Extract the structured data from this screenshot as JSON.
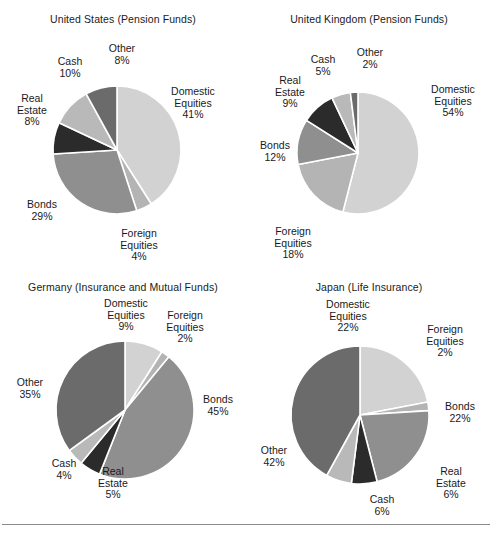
{
  "figure": {
    "background": "#ffffff",
    "rule_color": "#8c8c8c"
  },
  "palette": {
    "domestic_equities": "#d2d2d2",
    "foreign_equities": "#b4b4b4",
    "bonds": "#8f8f8f",
    "real_estate": "#2b2b2b",
    "cash": "#b9b9b9",
    "other": "#6b6b6b",
    "slice_outline": "#ffffff"
  },
  "panels": [
    {
      "id": "us",
      "title": "United States (Pension Funds)",
      "labels": [
        {
          "name": "Domestic\nEquities",
          "line1": "Domestic",
          "line2": "Equities",
          "pct": "41%"
        },
        {
          "name": "Foreign\nEquities",
          "line1": "Foreign",
          "line2": "Equities",
          "pct": "4%"
        },
        {
          "name": "Bonds",
          "line1": "Bonds",
          "line2": "",
          "pct": "29%"
        },
        {
          "name": "Real\nEstate",
          "line1": "Real",
          "line2": "Estate",
          "pct": "8%"
        },
        {
          "name": "Cash",
          "line1": "Cash",
          "line2": "",
          "pct": "10%"
        },
        {
          "name": "Other",
          "line1": "Other",
          "line2": "",
          "pct": "8%"
        }
      ]
    },
    {
      "id": "uk",
      "title": "United Kingdom (Pension Funds)",
      "labels": [
        {
          "name": "Domestic\nEquities",
          "line1": "Domestic",
          "line2": "Equities",
          "pct": "54%"
        },
        {
          "name": "Foreign\nEquities",
          "line1": "Foreign",
          "line2": "Equities",
          "pct": "18%"
        },
        {
          "name": "Bonds",
          "line1": "Bonds",
          "line2": "",
          "pct": "12%"
        },
        {
          "name": "Real\nEstate",
          "line1": "Real",
          "line2": "Estate",
          "pct": "9%"
        },
        {
          "name": "Cash",
          "line1": "Cash",
          "line2": "",
          "pct": "5%"
        },
        {
          "name": "Other",
          "line1": "Other",
          "line2": "",
          "pct": "2%"
        }
      ]
    },
    {
      "id": "de",
      "title": "Germany (Insurance and Mutual Funds)",
      "labels": [
        {
          "name": "Domestic\nEquities",
          "line1": "Domestic",
          "line2": "Equities",
          "pct": "9%"
        },
        {
          "name": "Foreign\nEquities",
          "line1": "Foreign",
          "line2": "Equities",
          "pct": "2%"
        },
        {
          "name": "Bonds",
          "line1": "Bonds",
          "line2": "",
          "pct": "45%"
        },
        {
          "name": "Real\nEstate",
          "line1": "Real",
          "line2": "Estate",
          "pct": "5%"
        },
        {
          "name": "Cash",
          "line1": "Cash",
          "line2": "",
          "pct": "4%"
        },
        {
          "name": "Other",
          "line1": "Other",
          "line2": "",
          "pct": "35%"
        }
      ]
    },
    {
      "id": "jp",
      "title": "Japan (Life Insurance)",
      "labels": [
        {
          "name": "Domestic\nEquities",
          "line1": "Domestic",
          "line2": "Equities",
          "pct": "22%"
        },
        {
          "name": "Foreign\nEquities",
          "line1": "Foreign",
          "line2": "Equities",
          "pct": "2%"
        },
        {
          "name": "Bonds",
          "line1": "Bonds",
          "line2": "",
          "pct": "22%"
        },
        {
          "name": "Real\nEstate",
          "line1": "Real",
          "line2": "Estate",
          "pct": "6%"
        },
        {
          "name": "Cash",
          "line1": "Cash",
          "line2": "",
          "pct": "6%"
        },
        {
          "name": "Other",
          "line1": "Other",
          "line2": "",
          "pct": "42%"
        }
      ]
    }
  ],
  "chart_data": [
    {
      "type": "pie",
      "title": "United States (Pension Funds)",
      "categories": [
        "Domestic Equities",
        "Foreign Equities",
        "Bonds",
        "Real Estate",
        "Cash",
        "Other"
      ],
      "values": [
        41,
        4,
        29,
        8,
        10,
        8
      ],
      "unit": "percent",
      "start_angle_deg": 0,
      "direction": "clockwise",
      "colors": [
        "#d2d2d2",
        "#b4b4b4",
        "#8f8f8f",
        "#2b2b2b",
        "#b9b9b9",
        "#6b6b6b"
      ],
      "legend": "none (direct labels)",
      "grid": false,
      "xlabel": "",
      "ylabel": ""
    },
    {
      "type": "pie",
      "title": "United Kingdom (Pension Funds)",
      "categories": [
        "Domestic Equities",
        "Foreign Equities",
        "Bonds",
        "Real Estate",
        "Cash",
        "Other"
      ],
      "values": [
        54,
        18,
        12,
        9,
        5,
        2
      ],
      "unit": "percent",
      "start_angle_deg": 0,
      "direction": "clockwise",
      "colors": [
        "#d2d2d2",
        "#b4b4b4",
        "#8f8f8f",
        "#2b2b2b",
        "#b9b9b9",
        "#6b6b6b"
      ],
      "legend": "none (direct labels)",
      "grid": false,
      "xlabel": "",
      "ylabel": ""
    },
    {
      "type": "pie",
      "title": "Germany (Insurance and Mutual Funds)",
      "categories": [
        "Domestic Equities",
        "Foreign Equities",
        "Bonds",
        "Real Estate",
        "Cash",
        "Other"
      ],
      "values": [
        9,
        2,
        45,
        5,
        4,
        35
      ],
      "unit": "percent",
      "start_angle_deg": 0,
      "direction": "clockwise",
      "colors": [
        "#d2d2d2",
        "#b4b4b4",
        "#8f8f8f",
        "#2b2b2b",
        "#b9b9b9",
        "#6b6b6b"
      ],
      "legend": "none (direct labels)",
      "grid": false,
      "xlabel": "",
      "ylabel": ""
    },
    {
      "type": "pie",
      "title": "Japan (Life Insurance)",
      "categories": [
        "Domestic Equities",
        "Foreign Equities",
        "Bonds",
        "Real Estate",
        "Cash",
        "Other"
      ],
      "values": [
        22,
        2,
        22,
        6,
        6,
        42
      ],
      "unit": "percent",
      "start_angle_deg": 0,
      "direction": "clockwise",
      "colors": [
        "#d2d2d2",
        "#b4b4b4",
        "#8f8f8f",
        "#2b2b2b",
        "#b9b9b9",
        "#6b6b6b"
      ],
      "legend": "none (direct labels)",
      "grid": false,
      "xlabel": "",
      "ylabel": ""
    }
  ]
}
